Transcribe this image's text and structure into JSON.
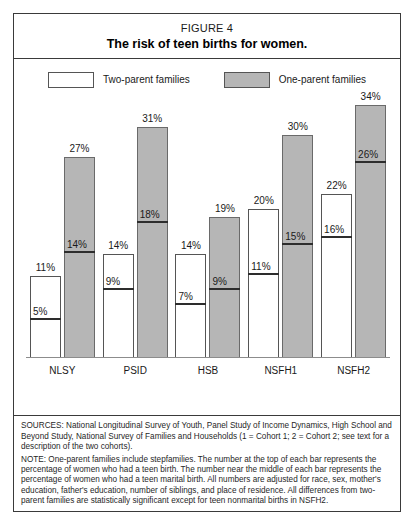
{
  "figure": {
    "number": "FIGURE 4",
    "title": "The risk of teen births for women."
  },
  "legend": {
    "items": [
      {
        "label": "Two-parent families",
        "swatch": "white",
        "color": "#ffffff"
      },
      {
        "label": "One-parent families",
        "swatch": "gray",
        "color": "#b6b6b6"
      }
    ]
  },
  "footnotes": {
    "sources": "SOURCES: National Longitudinal Survey of Youth, Panel Study of Income Dynamics, High School and Beyond Study, National Survey of Families and Households (1 = Cohort 1; 2 = Cohort 2; see text for a description of the two cohorts).",
    "note": "NOTE: One-parent families include stepfamilies. The number at the top of each bar represents the percentage of women who had a teen birth. The number near the middle of each bar represents the percentage of women who had a teen marital birth. All numbers are adjusted for race, sex, mother's education, father's education, number of siblings, and place of residence. All differences from two-parent families are statistically significant except for teen nonmarital births in NSFH2."
  },
  "chart_data": {
    "type": "bar",
    "title": "The risk of teen births for women.",
    "xlabel": "",
    "ylabel": "",
    "ylim": [
      0,
      36
    ],
    "grid": false,
    "legend_position": "top",
    "categories": [
      "NLSY",
      "PSID",
      "HSB",
      "NSFH1",
      "NSFH2"
    ],
    "series": [
      {
        "name": "Two-parent families",
        "color": "#ffffff",
        "values": [
          11,
          14,
          14,
          20,
          22
        ],
        "value_labels": [
          "11%",
          "14%",
          "14%",
          "20%",
          "22%"
        ],
        "marital_values": [
          5,
          9,
          7,
          11,
          16
        ],
        "marital_labels": [
          "5%",
          "9%",
          "7%",
          "11%",
          "16%"
        ]
      },
      {
        "name": "One-parent families",
        "color": "#b6b6b6",
        "values": [
          27,
          31,
          19,
          30,
          34
        ],
        "value_labels": [
          "27%",
          "31%",
          "19%",
          "30%",
          "34%"
        ],
        "marital_values": [
          14,
          18,
          9,
          15,
          26
        ],
        "marital_labels": [
          "14%",
          "18%",
          "9%",
          "15%",
          "26%"
        ]
      }
    ]
  }
}
